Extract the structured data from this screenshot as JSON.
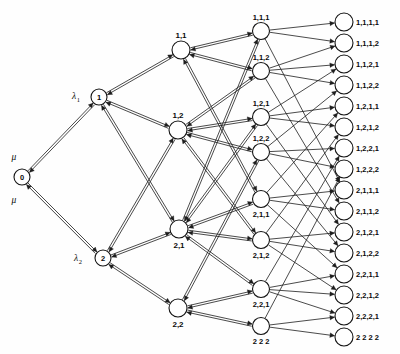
{
  "figure": {
    "background_color": "#fefefe",
    "line_color": "#1d1d1d",
    "node_fill": "#ffffff",
    "node_stroke": "#141414",
    "width": 400,
    "height": 354
  },
  "rates": {
    "mu_top": "μ",
    "mu_bottom": "μ",
    "lambda1_symbol": "λ",
    "lambda1_sub": "1",
    "lambda2_symbol": "λ",
    "lambda2_sub": "2"
  },
  "columns": [
    {
      "name": "root",
      "index": 0,
      "x": 22,
      "radius": 8,
      "nodes": [
        {
          "id": "n0",
          "label": "0",
          "x": 22,
          "y": 177,
          "label_dx": 0,
          "label_dy": 2.8,
          "label_anchor": "middle"
        }
      ]
    },
    {
      "name": "level-1",
      "index": 1,
      "x": 101,
      "radius": 8,
      "nodes": [
        {
          "id": "n1",
          "label": "1",
          "x": 99,
          "y": 97,
          "label_dx": 0,
          "label_dy": 2.8,
          "label_anchor": "middle"
        },
        {
          "id": "n2",
          "label": "2",
          "x": 103,
          "y": 258,
          "label_dx": 0,
          "label_dy": 2.8,
          "label_anchor": "middle"
        }
      ]
    },
    {
      "name": "level-2",
      "index": 2,
      "x": 180,
      "radius": 9,
      "nodes": [
        {
          "id": "n11",
          "label": "1,1",
          "x": 181,
          "y": 50,
          "label_dx": 0,
          "label_dy": -12,
          "label_anchor": "middle"
        },
        {
          "id": "n12",
          "label": "1,2",
          "x": 178,
          "y": 130,
          "label_dx": 0,
          "label_dy": -12,
          "label_anchor": "middle"
        },
        {
          "id": "n21",
          "label": "2,1",
          "x": 179,
          "y": 229,
          "label_dx": 0,
          "label_dy": 19,
          "label_anchor": "middle"
        },
        {
          "id": "n22",
          "label": "2,2",
          "x": 178,
          "y": 308,
          "label_dx": 0,
          "label_dy": 19,
          "label_anchor": "middle"
        }
      ]
    },
    {
      "name": "level-3",
      "index": 3,
      "x": 261,
      "radius": 8.5,
      "nodes": [
        {
          "id": "n111",
          "label": "1,1,1",
          "x": 261,
          "y": 31,
          "label_dx": 0,
          "label_dy": -11,
          "label_anchor": "middle"
        },
        {
          "id": "n112",
          "label": "1,1,2",
          "x": 261,
          "y": 71,
          "label_dx": 0,
          "label_dy": -11,
          "label_anchor": "middle"
        },
        {
          "id": "n121",
          "label": "1,2,1",
          "x": 261,
          "y": 117,
          "label_dx": 0,
          "label_dy": -11,
          "label_anchor": "middle"
        },
        {
          "id": "n122",
          "label": "1,2,2",
          "x": 261,
          "y": 152,
          "label_dx": 0,
          "label_dy": -11,
          "label_anchor": "middle"
        },
        {
          "id": "n211",
          "label": "2,1,1",
          "x": 261,
          "y": 199,
          "label_dx": 0,
          "label_dy": 18,
          "label_anchor": "middle"
        },
        {
          "id": "n212",
          "label": "2,1,2",
          "x": 261,
          "y": 240,
          "label_dx": 0,
          "label_dy": 18,
          "label_anchor": "middle"
        },
        {
          "id": "n221",
          "label": "2,2,1",
          "x": 261,
          "y": 289,
          "label_dx": 0,
          "label_dy": 18,
          "label_anchor": "middle"
        },
        {
          "id": "n222",
          "label": "2 2 2",
          "x": 261,
          "y": 326,
          "label_dx": 0,
          "label_dy": 18,
          "label_anchor": "middle"
        }
      ]
    },
    {
      "name": "level-4",
      "index": 4,
      "x": 344,
      "radius": 9,
      "nodes": [
        {
          "id": "n1111",
          "label": "1,1,1,1",
          "x": 344,
          "y": 22,
          "label_dx": 12,
          "label_dy": 3,
          "label_anchor": "start"
        },
        {
          "id": "n1112",
          "label": "1,1,1,2",
          "x": 344,
          "y": 43,
          "label_dx": 12,
          "label_dy": 3,
          "label_anchor": "start"
        },
        {
          "id": "n1121",
          "label": "1,1,2,1",
          "x": 344,
          "y": 64,
          "label_dx": 12,
          "label_dy": 3,
          "label_anchor": "start"
        },
        {
          "id": "n1122",
          "label": "1,1,2,2",
          "x": 344,
          "y": 85,
          "label_dx": 12,
          "label_dy": 3,
          "label_anchor": "start"
        },
        {
          "id": "n1211",
          "label": "1,2,1,1",
          "x": 344,
          "y": 106,
          "label_dx": 12,
          "label_dy": 3,
          "label_anchor": "start"
        },
        {
          "id": "n1212",
          "label": "1,2,1,2",
          "x": 344,
          "y": 127,
          "label_dx": 12,
          "label_dy": 3,
          "label_anchor": "start"
        },
        {
          "id": "n1221",
          "label": "1,2,2,1",
          "x": 344,
          "y": 148,
          "label_dx": 12,
          "label_dy": 3,
          "label_anchor": "start"
        },
        {
          "id": "n1222",
          "label": "1,2,2,2",
          "x": 344,
          "y": 169,
          "label_dx": 12,
          "label_dy": 3,
          "label_anchor": "start"
        },
        {
          "id": "n2111",
          "label": "2,1,1,1",
          "x": 344,
          "y": 190,
          "label_dx": 12,
          "label_dy": 3,
          "label_anchor": "start"
        },
        {
          "id": "n2112",
          "label": "2,1,1,2",
          "x": 344,
          "y": 211,
          "label_dx": 12,
          "label_dy": 3,
          "label_anchor": "start"
        },
        {
          "id": "n2121",
          "label": "2,1,2,1",
          "x": 344,
          "y": 232,
          "label_dx": 12,
          "label_dy": 3,
          "label_anchor": "start"
        },
        {
          "id": "n2122",
          "label": "2,1,2,2",
          "x": 344,
          "y": 253,
          "label_dx": 12,
          "label_dy": 3,
          "label_anchor": "start"
        },
        {
          "id": "n2211",
          "label": "2,2,1,1",
          "x": 344,
          "y": 274,
          "label_dx": 12,
          "label_dy": 3,
          "label_anchor": "start"
        },
        {
          "id": "n2212",
          "label": "2,2,1,2",
          "x": 344,
          "y": 295,
          "label_dx": 12,
          "label_dy": 3,
          "label_anchor": "start"
        },
        {
          "id": "n2221",
          "label": "2,2,2,1",
          "x": 344,
          "y": 316,
          "label_dx": 12,
          "label_dy": 3,
          "label_anchor": "start"
        },
        {
          "id": "n2222",
          "label": "2 2 2 2",
          "x": 344,
          "y": 337,
          "label_dx": 12,
          "label_dy": 3,
          "label_anchor": "start"
        }
      ]
    }
  ],
  "rate_labels": [
    {
      "id": "mu-top",
      "text": "μ",
      "sub": "",
      "x": 14,
      "y": 160
    },
    {
      "id": "mu-bottom",
      "text": "μ",
      "sub": "",
      "x": 14,
      "y": 203
    },
    {
      "id": "lambda-1",
      "text": "λ",
      "sub": "1",
      "x": 76,
      "y": 99
    },
    {
      "id": "lambda-2",
      "text": "λ",
      "sub": "2",
      "x": 78,
      "y": 261
    }
  ],
  "edges": [
    {
      "from": "n0",
      "to": "n1",
      "bidirectional": true
    },
    {
      "from": "n0",
      "to": "n2",
      "bidirectional": true
    },
    {
      "from": "n1",
      "to": "n11",
      "bidirectional": true
    },
    {
      "from": "n1",
      "to": "n12",
      "bidirectional": true
    },
    {
      "from": "n1",
      "to": "n21",
      "bidirectional": true
    },
    {
      "from": "n2",
      "to": "n12",
      "bidirectional": true
    },
    {
      "from": "n2",
      "to": "n21",
      "bidirectional": true
    },
    {
      "from": "n2",
      "to": "n22",
      "bidirectional": true
    },
    {
      "from": "n11",
      "to": "n111",
      "bidirectional": true
    },
    {
      "from": "n11",
      "to": "n112",
      "bidirectional": true
    },
    {
      "from": "n11",
      "to": "n211",
      "bidirectional": true
    },
    {
      "from": "n12",
      "to": "n112",
      "bidirectional": true
    },
    {
      "from": "n12",
      "to": "n121",
      "bidirectional": true
    },
    {
      "from": "n12",
      "to": "n122",
      "bidirectional": true
    },
    {
      "from": "n12",
      "to": "n212",
      "bidirectional": true
    },
    {
      "from": "n21",
      "to": "n111",
      "bidirectional": true
    },
    {
      "from": "n21",
      "to": "n121",
      "bidirectional": true
    },
    {
      "from": "n21",
      "to": "n211",
      "bidirectional": true
    },
    {
      "from": "n21",
      "to": "n212",
      "bidirectional": true
    },
    {
      "from": "n21",
      "to": "n221",
      "bidirectional": true
    },
    {
      "from": "n22",
      "to": "n122",
      "bidirectional": true
    },
    {
      "from": "n22",
      "to": "n221",
      "bidirectional": true
    },
    {
      "from": "n22",
      "to": "n222",
      "bidirectional": true
    },
    {
      "from": "n111",
      "to": "n1111",
      "bidirectional": false
    },
    {
      "from": "n111",
      "to": "n1112",
      "bidirectional": false
    },
    {
      "from": "n111",
      "to": "n2111",
      "bidirectional": false
    },
    {
      "from": "n112",
      "to": "n1112",
      "bidirectional": false
    },
    {
      "from": "n112",
      "to": "n1121",
      "bidirectional": false
    },
    {
      "from": "n112",
      "to": "n1122",
      "bidirectional": false
    },
    {
      "from": "n112",
      "to": "n2112",
      "bidirectional": false
    },
    {
      "from": "n121",
      "to": "n1121",
      "bidirectional": false
    },
    {
      "from": "n121",
      "to": "n1211",
      "bidirectional": false
    },
    {
      "from": "n121",
      "to": "n1212",
      "bidirectional": false
    },
    {
      "from": "n121",
      "to": "n2121",
      "bidirectional": false
    },
    {
      "from": "n122",
      "to": "n1122",
      "bidirectional": false
    },
    {
      "from": "n122",
      "to": "n1221",
      "bidirectional": false
    },
    {
      "from": "n122",
      "to": "n1222",
      "bidirectional": false
    },
    {
      "from": "n122",
      "to": "n2122",
      "bidirectional": false
    },
    {
      "from": "n211",
      "to": "n1211",
      "bidirectional": false
    },
    {
      "from": "n211",
      "to": "n2111",
      "bidirectional": false
    },
    {
      "from": "n211",
      "to": "n2112",
      "bidirectional": false
    },
    {
      "from": "n211",
      "to": "n2211",
      "bidirectional": false
    },
    {
      "from": "n212",
      "to": "n1212",
      "bidirectional": false
    },
    {
      "from": "n212",
      "to": "n2121",
      "bidirectional": false
    },
    {
      "from": "n212",
      "to": "n2122",
      "bidirectional": false
    },
    {
      "from": "n212",
      "to": "n2212",
      "bidirectional": false
    },
    {
      "from": "n221",
      "to": "n1221",
      "bidirectional": false
    },
    {
      "from": "n221",
      "to": "n2211",
      "bidirectional": false
    },
    {
      "from": "n221",
      "to": "n2212",
      "bidirectional": false
    },
    {
      "from": "n221",
      "to": "n2221",
      "bidirectional": false
    },
    {
      "from": "n222",
      "to": "n1222",
      "bidirectional": false
    },
    {
      "from": "n222",
      "to": "n2221",
      "bidirectional": false
    },
    {
      "from": "n222",
      "to": "n2222",
      "bidirectional": false
    }
  ]
}
